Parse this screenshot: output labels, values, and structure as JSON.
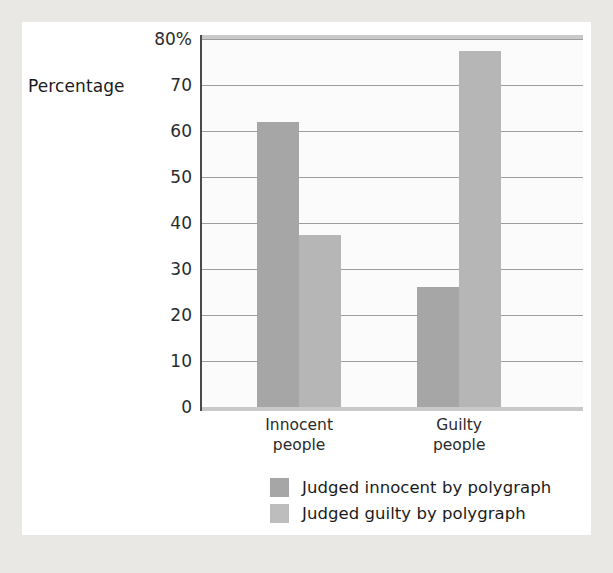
{
  "chart_data": {
    "type": "bar",
    "title": "",
    "subtitle": "",
    "xlabel": "",
    "ylabel": "Percentage",
    "ylim": [
      0,
      80
    ],
    "ytick_suffix_top": "%",
    "grid": true,
    "legend_position": "bottom",
    "categories": [
      "Innocent\npeople",
      "Guilty\npeople"
    ],
    "ytick_labels": [
      "80%",
      "70",
      "60",
      "50",
      "40",
      "30",
      "20",
      "10",
      "0"
    ],
    "ytick_values": [
      80,
      70,
      60,
      50,
      40,
      30,
      20,
      10,
      0
    ],
    "series": [
      {
        "name": "Judged innocent by polygraph",
        "color": "#a6a6a6",
        "values": [
          62,
          26
        ]
      },
      {
        "name": "Judged guilty by polygraph",
        "color": "#b6b6b6",
        "values": [
          37.5,
          77.5
        ]
      }
    ]
  },
  "axis": {
    "y_caption": "Percentage"
  },
  "legend": {
    "items": [
      {
        "label": "Judged innocent by polygraph",
        "swatch": "innocent-judged"
      },
      {
        "label": "Judged guilty by polygraph",
        "swatch": "guilty-judged"
      }
    ]
  }
}
